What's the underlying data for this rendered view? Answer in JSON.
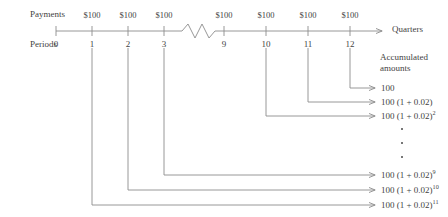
{
  "figure": {
    "rows": {
      "payments_label": "Payments",
      "periods_label": "Periods",
      "axis_label": "Quarters",
      "accumulated_title_line1": "Accumulated",
      "accumulated_title_line2": "amounts"
    },
    "payment_amount": "$100",
    "payments": [
      "$100",
      "$100",
      "$100",
      "$100",
      "$100",
      "$100",
      "$100"
    ],
    "periods": [
      "0",
      "1",
      "2",
      "3",
      "9",
      "10",
      "11",
      "12"
    ],
    "break_between": [
      "3",
      "9"
    ],
    "accumulated_amounts": [
      {
        "base": "100",
        "suffix": "",
        "exponent": "",
        "from_period": "12"
      },
      {
        "base": "100 (1 + 0.02)",
        "suffix": "",
        "exponent": "",
        "from_period": "11"
      },
      {
        "base": "100 (1 + 0.02)",
        "suffix": "",
        "exponent": "2",
        "from_period": "10"
      },
      {
        "base": "100 (1 + 0.02)",
        "suffix": "",
        "exponent": "9",
        "from_period": "3"
      },
      {
        "base": "100 (1 + 0.02)",
        "suffix": "",
        "exponent": "10",
        "from_period": "2"
      },
      {
        "base": "100 (1 + 0.02)",
        "suffix": "",
        "exponent": "11",
        "from_period": "1"
      }
    ],
    "ellipsis_dots": 3,
    "colors": {
      "line": "#8c8c8c",
      "text": "#3f3f3f",
      "background": "#ffffff"
    }
  }
}
